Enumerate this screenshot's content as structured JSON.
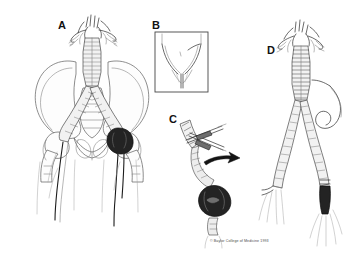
{
  "figure": {
    "background_color": "#ffffff",
    "ink_color": "#2b2b2b",
    "width": 355,
    "height": 268,
    "style": "pen-and-ink medical line illustration, four panels"
  },
  "panels": [
    {
      "id": "A",
      "label": "A",
      "label_position": {
        "x": 58,
        "y": 20
      },
      "caption": "Aortobifemoral bypass graft in situ over bony pelvis with dark anastomotic aneurysm at right femoral anastomosis",
      "elements": [
        "abdominal aorta with branching renal and visceral vessels",
        "tube graft body descending midline",
        "graft bifurcation into two limbs crossing the pelvic brim",
        "iliac crests and sacrum",
        "both femoral heads and proximal femurs",
        "pubic symphysis and obturator foramina",
        "dark round anastomotic aneurysm at right groin",
        "distal femoral arteries descending into thighs"
      ]
    },
    {
      "id": "B",
      "label": "B",
      "label_position": {
        "x": 152,
        "y": 20
      },
      "caption": "Boxed inset: groin incision exposure detail",
      "box": {
        "x": 155,
        "y": 32,
        "width": 53,
        "height": 60
      },
      "elements": [
        "rectangular frame border",
        "inverted V inguinal crease",
        "vertical groin incision line",
        "short oblique marker stroke"
      ]
    },
    {
      "id": "C",
      "label": "C",
      "label_position": {
        "x": 169,
        "y": 114
      },
      "caption": "Graft limb divided with clamps; aneurysm excised and rotated away, shown by curved arrow",
      "elements": [
        "hatched graft limb segment",
        "pair of crossed vascular clamps",
        "curved black arrow indicating direction of removal",
        "dark excised aneurysm sac",
        "distal artery stump below"
      ]
    },
    {
      "id": "D",
      "label": "D",
      "label_position": {
        "x": 267,
        "y": 45
      },
      "caption": "Completed revision: new graft limbs anastomosed, with suture tails at distal ends",
      "elements": [
        "aortic arch branches at top",
        "hatched tube graft body",
        "bifurcated graft limbs",
        "looped suture with needle at right",
        "suture tails at both distal anastomoses",
        "dark reconstructed distal anastomosis on right limb"
      ]
    }
  ],
  "credit": {
    "text": "© Baylor College of Medicine 1993",
    "position": {
      "x": 210,
      "y": 239
    }
  }
}
